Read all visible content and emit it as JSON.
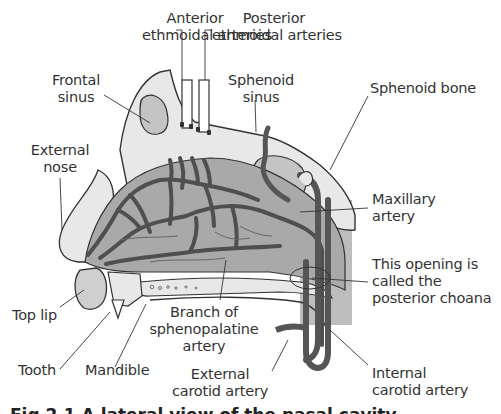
{
  "diagram": {
    "type": "anatomical-cross-section",
    "colors": {
      "background": "#ffffff",
      "mucosa_fill": "#a9a9a9",
      "bone_fill": "#e8e8e8",
      "sinus_fill": "#c4c4c4",
      "artery": "#555555",
      "outline": "#333333",
      "posterior_region": "#bdbdbd"
    },
    "labels": {
      "anterior_ethmoidal": [
        "Anterior",
        "ethmoidal arteries"
      ],
      "posterior_ethmoidal": [
        "Posterior",
        "ethmoidal arteries"
      ],
      "frontal_sinus": [
        "Frontal",
        "sinus"
      ],
      "sphenoid_sinus": [
        "Sphenoid",
        "sinus"
      ],
      "sphenoid_bone": [
        "Sphenoid bone"
      ],
      "external_nose": [
        "External",
        "nose"
      ],
      "maxillary_artery": [
        "Maxillary",
        "artery"
      ],
      "posterior_choana": [
        "This opening is",
        "called the",
        "posterior choana"
      ],
      "top_lip": [
        "Top lip"
      ],
      "branch_sphenopalatine": [
        "Branch of",
        "sphenopalatine",
        "artery"
      ],
      "tooth": [
        "Tooth"
      ],
      "mandible": [
        "Mandible"
      ],
      "external_carotid": [
        "External",
        "carotid artery"
      ],
      "internal_carotid": [
        "Internal",
        "carotid artery"
      ]
    },
    "caption": {
      "text": "Fig 2.1 A lateral view of the nasal cavity",
      "clipped": true
    }
  }
}
